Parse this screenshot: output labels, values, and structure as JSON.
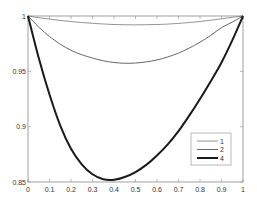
{
  "chart_data": {
    "type": "line",
    "title": "",
    "xlabel": "",
    "ylabel": "",
    "xlim": [
      0,
      1
    ],
    "ylim": [
      0.85,
      1.0
    ],
    "grid": false,
    "legend_position": "lower right",
    "x_ticks": [
      "0",
      "0.1",
      "0.2",
      "0.3",
      "0.4",
      "0.5",
      "0.6",
      "0.7",
      "0.8",
      "0.9",
      "1"
    ],
    "y_ticks": [
      "0.85",
      "0.9",
      "0.95",
      "1"
    ],
    "x": [
      0,
      0.05,
      0.1,
      0.15,
      0.2,
      0.25,
      0.3,
      0.35,
      0.4,
      0.45,
      0.5,
      0.55,
      0.6,
      0.65,
      0.7,
      0.75,
      0.8,
      0.85,
      0.9,
      0.95,
      1.0
    ],
    "series": [
      {
        "name": "1",
        "line_width": 0.8,
        "color": "#777777",
        "values": [
          1.0,
          0.9985,
          0.9972,
          0.996,
          0.995,
          0.9941,
          0.9934,
          0.9928,
          0.9923,
          0.9921,
          0.992,
          0.9921,
          0.9923,
          0.9927,
          0.9933,
          0.9941,
          0.995,
          0.9962,
          0.9975,
          0.9988,
          1.0
        ]
      },
      {
        "name": "2",
        "line_width": 1.0,
        "color": "#666666",
        "values": [
          1.0,
          0.99,
          0.9815,
          0.9745,
          0.969,
          0.965,
          0.962,
          0.9595,
          0.958,
          0.9573,
          0.9575,
          0.9585,
          0.9603,
          0.963,
          0.9665,
          0.971,
          0.9763,
          0.9825,
          0.9895,
          0.9945,
          1.0
        ]
      },
      {
        "name": "4",
        "line_width": 2.0,
        "color": "#1a1a1a",
        "values": [
          1.0,
          0.962,
          0.929,
          0.901,
          0.88,
          0.866,
          0.857,
          0.8525,
          0.852,
          0.8545,
          0.859,
          0.8655,
          0.874,
          0.884,
          0.896,
          0.91,
          0.925,
          0.941,
          0.958,
          0.978,
          1.0
        ]
      }
    ]
  },
  "legend": {
    "items": [
      {
        "label": "1"
      },
      {
        "label": "2"
      },
      {
        "label": "4"
      }
    ]
  }
}
